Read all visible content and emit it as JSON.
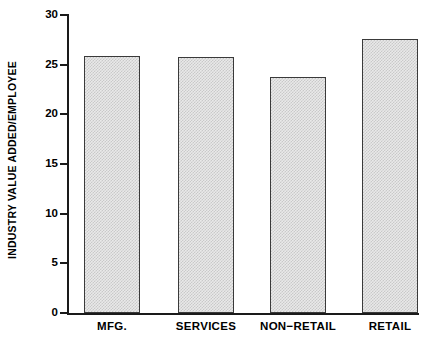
{
  "chart_data": {
    "type": "bar",
    "title": "",
    "subtitle": "",
    "xlabel": "",
    "ylabel": "INDUSTRY VALUE ADDED/EMPLOYEE",
    "categories": [
      "MFG.",
      "SERVICES",
      "NON−RETAIL",
      "RETAIL"
    ],
    "values": [
      25.9,
      25.8,
      23.8,
      27.6
    ],
    "ylim": [
      0,
      30
    ],
    "yticks": [
      0,
      5,
      10,
      15,
      20,
      25,
      30
    ],
    "ytick_labels": [
      "0",
      "5",
      "10",
      "15",
      "20",
      "25",
      "30"
    ],
    "grid": false,
    "legend": false,
    "legend_position": "none",
    "bar_fill_color": "#d8d8d8",
    "bar_edge_color": "#3a3a3a",
    "axis_color": "#1a1a1a",
    "background_color": "#ffffff"
  }
}
